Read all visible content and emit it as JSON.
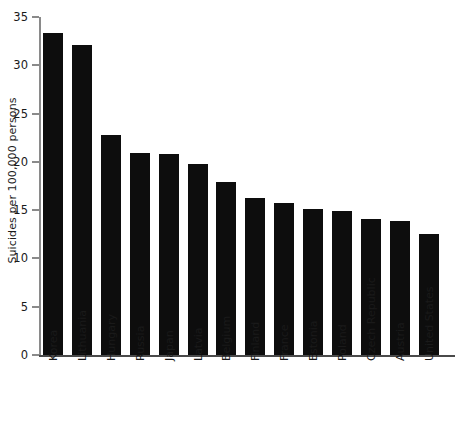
{
  "chart_data": {
    "type": "bar",
    "title": "",
    "xlabel": "",
    "ylabel": "Suicides per 100,000 persons",
    "ylim": [
      0,
      35
    ],
    "ytick_step": 5,
    "yticks": [
      0,
      5,
      10,
      15,
      20,
      25,
      30,
      35
    ],
    "ytick_labels": [
      "0",
      "5",
      "10",
      "15",
      "20",
      "25",
      "30",
      "35"
    ],
    "grid": false,
    "legend": null,
    "bar_color": "#0d0d0d",
    "axis_color": "#8a8a8a",
    "categories": [
      "Korea",
      "Lithuania",
      "Hungary",
      "Russia",
      "Japan",
      "Latvia",
      "Belgium",
      "Finland",
      "France",
      "Estonia",
      "Poland",
      "Czech Republic",
      "Austria",
      "United States"
    ],
    "values": [
      33.3,
      32.1,
      22.8,
      20.9,
      20.8,
      19.8,
      17.9,
      16.3,
      15.7,
      15.1,
      14.9,
      14.1,
      13.9,
      12.5
    ]
  },
  "caption_remnant": ""
}
